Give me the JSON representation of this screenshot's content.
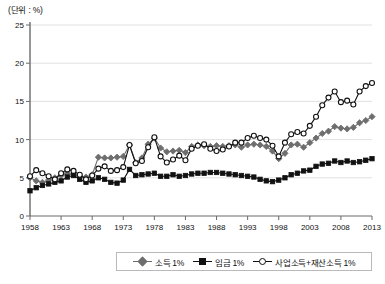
{
  "chart_title_unit": "(단위 : %)",
  "legend": {
    "position": "bottom-center",
    "items": [
      {
        "label": "소득 1%",
        "marker": "diamond",
        "color": "#6e6e6e",
        "fill": "#6e6e6e",
        "name": "series-income"
      },
      {
        "label": "임금 1%",
        "marker": "square",
        "color": "#111111",
        "fill": "#111111",
        "name": "series-wage"
      },
      {
        "label": "사업소득+재산소득 1%",
        "marker": "circle",
        "color": "#111111",
        "fill": "#ffffff",
        "name": "series-business-property"
      }
    ]
  },
  "chart_data": {
    "type": "line",
    "title": "",
    "subtitle": "",
    "xlabel": "",
    "ylabel": "",
    "unit": "%",
    "grid": true,
    "legend_position": "bottom-center",
    "xlim": [
      1958,
      2013
    ],
    "ylim": [
      0,
      25
    ],
    "yticks": [
      0,
      5,
      10,
      15,
      20,
      25
    ],
    "xticks": [
      1958,
      1963,
      1968,
      1973,
      1978,
      1983,
      1988,
      1993,
      1998,
      2003,
      2008,
      2013
    ],
    "x": [
      1958,
      1959,
      1960,
      1961,
      1962,
      1963,
      1964,
      1965,
      1966,
      1967,
      1968,
      1969,
      1970,
      1971,
      1972,
      1973,
      1974,
      1975,
      1976,
      1977,
      1978,
      1979,
      1980,
      1981,
      1982,
      1983,
      1984,
      1985,
      1986,
      1987,
      1988,
      1989,
      1990,
      1991,
      1992,
      1993,
      1994,
      1995,
      1996,
      1997,
      1998,
      1999,
      2000,
      2001,
      2002,
      2003,
      2004,
      2005,
      2006,
      2007,
      2008,
      2009,
      2010,
      2011,
      2012,
      2013
    ],
    "series": [
      {
        "name": "소득 1%",
        "marker": "diamond",
        "color": "#6e6e6e",
        "fill": "#6e6e6e",
        "values": [
          5.0,
          4.6,
          4.4,
          4.7,
          5.0,
          5.3,
          5.6,
          5.4,
          5.2,
          5.1,
          5.4,
          7.7,
          7.6,
          7.6,
          7.7,
          7.8,
          9.3,
          7.0,
          7.6,
          9.4,
          10.2,
          8.9,
          8.4,
          8.5,
          8.6,
          8.3,
          9.1,
          9.3,
          9.2,
          9.1,
          9.2,
          9.1,
          9.2,
          9.3,
          9.0,
          9.3,
          9.4,
          9.3,
          9.1,
          8.5,
          7.5,
          8.2,
          9.3,
          9.4,
          9.0,
          9.6,
          10.2,
          10.8,
          11.1,
          11.7,
          11.5,
          11.4,
          11.6,
          12.2,
          12.5,
          13.0
        ],
        "note": "Top 1% income share"
      },
      {
        "name": "임금 1%",
        "marker": "square",
        "color": "#111111",
        "fill": "#111111",
        "values": [
          3.3,
          3.7,
          4.0,
          4.2,
          4.4,
          4.6,
          5.1,
          5.3,
          4.8,
          4.4,
          4.6,
          5.0,
          4.8,
          4.4,
          4.3,
          4.7,
          6.1,
          5.3,
          5.4,
          5.5,
          5.6,
          5.2,
          5.2,
          5.4,
          5.2,
          5.3,
          5.5,
          5.6,
          5.6,
          5.7,
          5.7,
          5.6,
          5.5,
          5.4,
          5.3,
          5.2,
          5.1,
          4.8,
          4.6,
          4.5,
          4.7,
          5.0,
          5.4,
          5.6,
          5.9,
          6.0,
          6.5,
          6.8,
          6.9,
          7.2,
          7.0,
          7.2,
          7.0,
          7.1,
          7.3,
          7.5
        ],
        "note": "Top 1% wage share"
      },
      {
        "name": "사업소득+재산소득 1%",
        "marker": "circle",
        "color": "#111111",
        "fill": "#ffffff",
        "values": [
          5.2,
          6.0,
          5.6,
          5.2,
          4.8,
          5.6,
          6.1,
          5.9,
          5.4,
          4.8,
          5.3,
          6.2,
          6.5,
          5.9,
          6.0,
          6.4,
          9.3,
          6.9,
          7.2,
          9.0,
          10.3,
          7.8,
          7.0,
          7.4,
          7.9,
          7.3,
          8.8,
          9.2,
          9.4,
          8.8,
          8.5,
          8.7,
          9.1,
          9.6,
          9.6,
          10.2,
          10.5,
          10.2,
          10.0,
          9.2,
          7.8,
          9.6,
          10.7,
          11.0,
          10.8,
          11.8,
          13.0,
          14.5,
          15.5,
          16.3,
          14.9,
          15.1,
          14.6,
          16.3,
          17.0,
          17.4
        ],
        "note": "Top 1% business + property income share"
      }
    ]
  }
}
